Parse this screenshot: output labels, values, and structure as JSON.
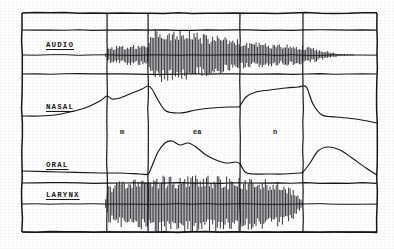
{
  "figure": {
    "background_color": "#ffffff",
    "ink_color": "#17171a",
    "frame": {
      "x": 22,
      "y": 13,
      "width": 355,
      "height": 219
    }
  },
  "traces": [
    {
      "id": "audio",
      "label": "AUDIO",
      "label_x": 46,
      "label_y": 41,
      "baseline_y": 55,
      "kind": "oscillogram"
    },
    {
      "id": "nasal",
      "label": "NASAL",
      "label_x": 46,
      "label_y": 103,
      "baseline_y": 118,
      "kind": "envelope"
    },
    {
      "id": "oral",
      "label": "ORAL",
      "label_x": 46,
      "label_y": 161,
      "baseline_y": 173,
      "kind": "envelope"
    },
    {
      "id": "larynx",
      "label": "LARYNX",
      "label_x": 46,
      "label_y": 191,
      "baseline_y": 204,
      "kind": "oscillogram"
    }
  ],
  "segments": [
    {
      "label": "m",
      "x": 120,
      "y": 128
    },
    {
      "label": "ea",
      "x": 193,
      "y": 128
    },
    {
      "label": "n",
      "x": 273,
      "y": 128
    }
  ],
  "segment_boundaries": [
    107,
    148,
    240,
    303
  ],
  "horizontal_rules": [
    30,
    74,
    183,
    232
  ],
  "chart_data": {
    "type": "line",
    "xlabel": "time",
    "ylabel": "amplitude",
    "grid": false,
    "legend": "none",
    "x_axis_units": "frame pixels",
    "phoneme_sequence": [
      "m",
      "ea",
      "n"
    ],
    "boundaries_px": [
      107,
      148,
      240,
      303
    ],
    "series": [
      {
        "name": "AUDIO",
        "kind": "oscillogram",
        "baseline_y": 55,
        "description": "silence to x=107, low amplitude buzz across m, large burst through ea, tapering through n to silence after x=330",
        "envelope_x": [
          22,
          105,
          108,
          130,
          147,
          150,
          158,
          170,
          185,
          200,
          215,
          228,
          238,
          242,
          258,
          275,
          290,
          303,
          315,
          326,
          340,
          377
        ],
        "envelope_amp": [
          0,
          0,
          8,
          10,
          11,
          24,
          27,
          26,
          24,
          21,
          19,
          17,
          15,
          13,
          12,
          11,
          10,
          9,
          7,
          4,
          1,
          0
        ]
      },
      {
        "name": "NASAL",
        "kind": "envelope",
        "baseline_y": 118,
        "description": "low before speech, rises through m to a peak at the m/ea boundary, falls sharply during ea, rises again for n to a second peak, then falls",
        "x": [
          22,
          40,
          55,
          70,
          85,
          100,
          107,
          112,
          120,
          132,
          142,
          148,
          152,
          158,
          166,
          180,
          196,
          212,
          228,
          238,
          240,
          246,
          256,
          270,
          286,
          298,
          303,
          307,
          313,
          322,
          336,
          356,
          377
        ],
        "y": [
          116,
          116,
          115,
          112,
          108,
          101,
          96,
          99,
          98,
          93,
          89,
          86,
          89,
          100,
          111,
          113,
          110,
          108,
          107,
          107,
          106,
          97,
          92,
          90,
          88,
          87,
          86,
          88,
          104,
          115,
          117,
          119,
          123
        ]
      },
      {
        "name": "ORAL",
        "kind": "envelope",
        "baseline_y": 173,
        "description": "flat and closed through m, opens sharply at the m/ea boundary into a double-humped peak through ea, closes to baseline through n, reopens after the final boundary then decays",
        "x": [
          22,
          60,
          100,
          120,
          140,
          148,
          152,
          158,
          165,
          172,
          180,
          188,
          196,
          206,
          216,
          226,
          236,
          240,
          245,
          252,
          266,
          284,
          300,
          303,
          310,
          318,
          328,
          340,
          352,
          366,
          377
        ],
        "y": [
          171,
          172,
          173,
          173,
          174,
          174,
          166,
          152,
          143,
          141,
          145,
          143,
          147,
          155,
          160,
          163,
          162,
          164,
          172,
          174,
          174,
          174,
          173,
          172,
          163,
          151,
          147,
          150,
          158,
          168,
          175
        ]
      },
      {
        "name": "LARYNX",
        "kind": "oscillogram",
        "baseline_y": 204,
        "description": "flat before voicing, strong periodic voicing from x=108 through x=300, then flat",
        "envelope_x": [
          22,
          105,
          108,
          120,
          140,
          148,
          160,
          180,
          200,
          220,
          240,
          260,
          278,
          292,
          300,
          304,
          340,
          377
        ],
        "envelope_amp": [
          0,
          0,
          20,
          22,
          24,
          27,
          28,
          28,
          28,
          27,
          26,
          25,
          22,
          16,
          6,
          0,
          0,
          0
        ]
      }
    ]
  }
}
